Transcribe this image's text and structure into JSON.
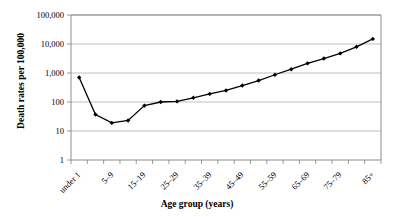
{
  "chart_data": {
    "type": "line",
    "title": "",
    "xlabel": "Age group (years)",
    "ylabel": "Death rates per 100,000",
    "yscale": "log",
    "ylim": [
      1,
      100000
    ],
    "grid": true,
    "legend": false,
    "ytick_labels": [
      "100,000",
      "10,000",
      "1,000",
      "100",
      "10",
      "1"
    ],
    "ytick_values": [
      100000,
      10000,
      1000,
      100,
      10,
      1
    ],
    "categories": [
      "under 1",
      "1–4",
      "5–9",
      "10–14",
      "15–19",
      "20–24",
      "25–29",
      "30–34",
      "35–39",
      "40–44",
      "45–49",
      "50–54",
      "55–59",
      "60–64",
      "65–69",
      "70–74",
      "75–79",
      "80–84",
      "85+"
    ],
    "xtick_labels_shown": [
      "under 1",
      "5–9",
      "15–19",
      "25–29",
      "35–39",
      "45–49",
      "55–59",
      "65–69",
      "75–79",
      "85+"
    ],
    "values": [
      700,
      37,
      19,
      23,
      75,
      100,
      105,
      140,
      190,
      250,
      370,
      550,
      870,
      1350,
      2150,
      3150,
      4750,
      8000,
      15000
    ],
    "series": [
      {
        "name": "Death rate",
        "values": [
          700,
          37,
          19,
          23,
          75,
          100,
          105,
          140,
          190,
          250,
          370,
          550,
          870,
          1350,
          2150,
          3150,
          4750,
          8000,
          15000
        ]
      }
    ],
    "line_color": "#000000",
    "marker": "diamond",
    "marker_color": "#000000",
    "grid_color": "#b0b0b0",
    "axis_color": "#808080",
    "background": "#ffffff"
  }
}
